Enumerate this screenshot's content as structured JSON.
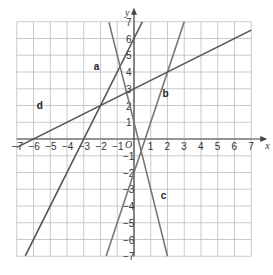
{
  "chart_data": {
    "type": "line",
    "title": "",
    "xlabel": "x",
    "ylabel": "y",
    "xlim": [
      -7,
      7
    ],
    "ylim": [
      -7,
      7
    ],
    "grid": true,
    "x_ticks": [
      -7,
      -6,
      -5,
      -4,
      -3,
      -2,
      -1,
      1,
      2,
      3,
      4,
      5,
      6,
      7
    ],
    "y_ticks": [
      -7,
      -6,
      -5,
      -4,
      -3,
      -2,
      -1,
      1,
      2,
      3,
      4,
      5,
      6,
      7
    ],
    "origin_label": "O",
    "series": [
      {
        "name": "a",
        "equation": "y = 2x + 6",
        "m": 2,
        "c": 6,
        "color": "#555555"
      },
      {
        "name": "b",
        "equation": "y = 3x - 2",
        "m": 3,
        "c": -2,
        "color": "#777777"
      },
      {
        "name": "c",
        "equation": "y = -4x + 1",
        "m": -4,
        "c": 1,
        "color": "#777777"
      },
      {
        "name": "d",
        "equation": "y = 0.5x + 3",
        "m": 0.5,
        "c": 3,
        "color": "#555555"
      }
    ],
    "labels": [
      {
        "text": "a",
        "x": -2.4,
        "y": 4.1
      },
      {
        "text": "b",
        "x": 1.7,
        "y": 2.5
      },
      {
        "text": "c",
        "x": 1.6,
        "y": -3.6
      },
      {
        "text": "d",
        "x": -5.8,
        "y": 1.8
      }
    ]
  }
}
